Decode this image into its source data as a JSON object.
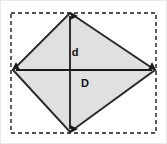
{
  "figure": {
    "name": "rhombus-diagonals-diagram",
    "type": "geometry-diagram",
    "width": 167,
    "height": 144,
    "background_color": "#ffffff",
    "outer_border_color": "#e8e8e8"
  },
  "bounding_box": {
    "name": "dashed-bounding-rectangle",
    "stroke_color": "#1a1a1a",
    "stroke_width": 1.4,
    "dash_pattern": "4 3",
    "x": 11,
    "y": 13,
    "width": 145,
    "height": 120
  },
  "shape": {
    "name": "rhombus",
    "fill_color": "#e0e0e0",
    "stroke_color": "#2b2b2b",
    "stroke_width": 2,
    "vertices": [
      {
        "name": "top-vertex",
        "x": 70,
        "y": 13
      },
      {
        "name": "right-vertex",
        "x": 155,
        "y": 70
      },
      {
        "name": "bottom-vertex",
        "x": 70,
        "y": 132
      },
      {
        "name": "left-vertex",
        "x": 13,
        "y": 70
      }
    ]
  },
  "diagonals": [
    {
      "name": "minor-diagonal-vertical",
      "label": "d",
      "label_x": 75,
      "label_y": 56,
      "x1": 70,
      "y1": 16,
      "x2": 70,
      "y2": 129,
      "stroke_color": "#1a1a1a",
      "stroke_width": 1.8,
      "arrowheads": "both"
    },
    {
      "name": "major-diagonal-horizontal",
      "label": "D",
      "label_x": 85,
      "label_y": 87,
      "x1": 16,
      "y1": 70,
      "x2": 152,
      "y2": 70,
      "stroke_color": "#1a1a1a",
      "stroke_width": 1.8,
      "arrowheads": "both"
    }
  ],
  "labels": {
    "minor_diagonal": "d",
    "major_diagonal": "D"
  }
}
